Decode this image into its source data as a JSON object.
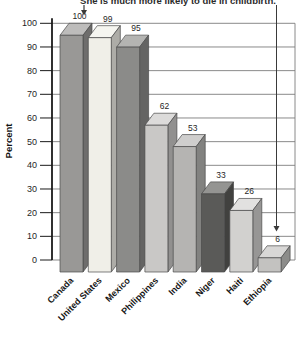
{
  "chart_data": {
    "type": "bar",
    "title": "",
    "xlabel": "",
    "ylabel": "Percent",
    "ylim": [
      0,
      100
    ],
    "yticks": [
      0,
      10,
      20,
      30,
      40,
      50,
      60,
      70,
      80,
      90,
      100
    ],
    "grid": true,
    "legend": false,
    "categories": [
      "Canada",
      "United States",
      "Mexico",
      "Philippines",
      "India",
      "Niger",
      "Haiti",
      "Ethiopia"
    ],
    "values": [
      100,
      99,
      95,
      62,
      53,
      33,
      26,
      6
    ],
    "bar_colors": [
      "#999896",
      "#f0efe8",
      "#8b8b89",
      "#c9c8c6",
      "#b5b4b2",
      "#5a5a58",
      "#d2d1cf",
      "#c3c2c0"
    ],
    "annotation": {
      "text": "She is much more likely to die in childbirth.",
      "targets": [
        "Canada",
        "Ethiopia"
      ]
    }
  },
  "colors": {
    "axis": "#1a1a1a",
    "grid": "#7d7d7d",
    "bar_outline": "#4a4a4a",
    "arrow": "#3a3a3a",
    "background": "#ffffff"
  }
}
